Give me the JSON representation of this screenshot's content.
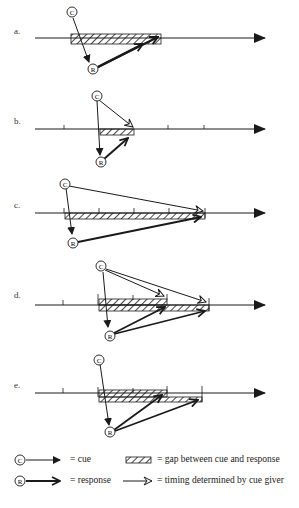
{
  "panels": [
    {
      "label": "a.",
      "description": "Cue given, response delayed past end of gap (gap spans cue to response)"
    },
    {
      "label": "b.",
      "description": "Short gap; cue giver determines timing"
    },
    {
      "label": "c.",
      "description": "Long gap; cue giver determines timing"
    },
    {
      "label": "d.",
      "description": "Two cues with timing determined by cue giver, two responses, two overlapping gaps"
    },
    {
      "label": "e.",
      "description": "One cue, two responses, two overlapping gaps"
    }
  ],
  "legend": {
    "cue_symbol": "©",
    "cue_text": "= cue",
    "response_symbol": "®",
    "response_text": "= response",
    "gap_text": "= gap between cue and response",
    "timing_text": "= timing determined by cue giver"
  },
  "symbols": {
    "cue": "C",
    "response": "R"
  },
  "colors": {
    "ink": "#1a1a1a",
    "background": "#ffffff"
  }
}
